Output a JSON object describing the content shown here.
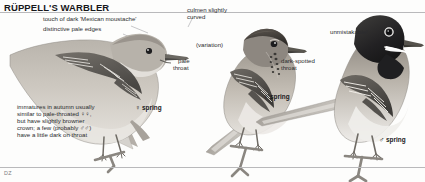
{
  "plate": {
    "title": "RÜPPELL'S WARBLER",
    "artist_signature": "DZ",
    "species_count": 3
  },
  "annotations": {
    "moustache": "touch of dark 'Mexican moustache'",
    "pale_edges": "distinctive pale edges",
    "culmen_line1": "culmen slightly",
    "culmen_line2": "curved",
    "variation": "(variation)",
    "pale_throat_line1": "pale",
    "pale_throat_line2": "throat",
    "dark_spotted_line1": "dark-spotted",
    "dark_spotted_line2": "throat",
    "unmistakable": "unmistakable!",
    "immature_note_line1": "immatures in autumn usually",
    "immature_note_line2": "similar to pale-throated ♀♀,",
    "immature_note_line3": "but have slightly browner",
    "immature_note_line4": "crown; a few (probably ♂♂)",
    "immature_note_line5": "have a little dark on throat"
  },
  "figure_labels": [
    {
      "symbol": "♀",
      "text": "spring",
      "id": "female-spring-left"
    },
    {
      "symbol": "♀",
      "text": "spring",
      "id": "female-spring-middle"
    },
    {
      "symbol": "♂",
      "text": "spring",
      "id": "male-spring-right"
    }
  ],
  "colors": {
    "ink": "#2b2b2e",
    "title_ink": "#17171a",
    "leader_line": "#9a9a9d",
    "rule": "#b9b9bb",
    "bird_body_light": "#cfcbc4",
    "bird_body_mid": "#a9a49c",
    "bird_body_dark": "#6f6b65",
    "bird_head_dark": "#2a2a2c",
    "wing_dark": "#4a4845",
    "perch": "#8a8680",
    "background": "#fdfdfc"
  }
}
